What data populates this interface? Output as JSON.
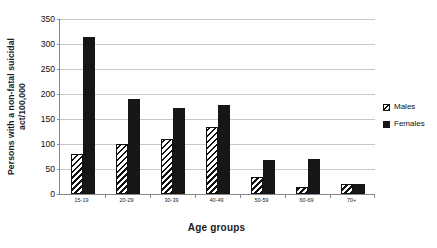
{
  "chart_data": {
    "type": "bar",
    "title": "",
    "categories": [
      "15-19",
      "20-29",
      "30-39",
      "40-49",
      "50-59",
      "60-69",
      "70+"
    ],
    "series": [
      {
        "name": "Males",
        "values": [
          80,
          100,
          110,
          135,
          35,
          15,
          20
        ],
        "color": "#111111",
        "pattern": "diagonal-hatch"
      },
      {
        "name": "Females",
        "values": [
          315,
          190,
          172,
          178,
          68,
          70,
          20
        ],
        "color": "#161616",
        "pattern": "solid"
      }
    ],
    "xlabel": "Age groups",
    "ylabel": "Persons with a non-fatal suicidal act/100,000",
    "ylabel_line1": "Persons with a non-fatal suicidal",
    "ylabel_line2": "act/100,000",
    "ylim": [
      0,
      350
    ],
    "ytick_step": 50,
    "yticks": [
      "350",
      "300",
      "250",
      "200",
      "150",
      "100",
      "50",
      "0"
    ],
    "grid": "horizontal",
    "legend_position": "right-outside"
  },
  "legend": {
    "items": [
      {
        "label": "Males",
        "swatch": "hatched-swatch"
      },
      {
        "label": "Females",
        "swatch": "solid-swatch"
      }
    ]
  }
}
